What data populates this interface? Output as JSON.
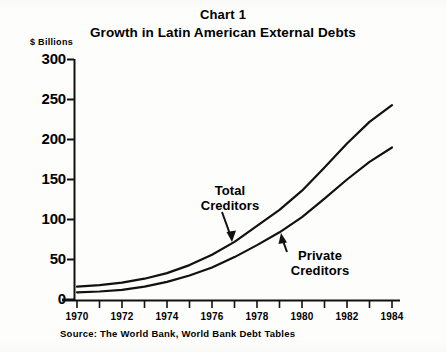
{
  "header": {
    "chart_label": "Chart 1",
    "title": "Growth in Latin American External Debts"
  },
  "axis": {
    "unit_label": "$ Billions",
    "y_ticks": [
      "300",
      "250",
      "200",
      "150",
      "100",
      "50",
      "0"
    ],
    "x_ticks": [
      "1970",
      "1972",
      "1974",
      "1976",
      "1978",
      "1980",
      "1982",
      "1984"
    ]
  },
  "annotations": {
    "total_line1": "Total",
    "total_line2": "Creditors",
    "private_line1": "Private",
    "private_line2": "Creditors"
  },
  "footer": {
    "source": "Source:  The World Bank, World Bank Debt Tables"
  },
  "colors": {
    "ink": "#111111",
    "paper": "#fdfdfc"
  },
  "chart_data": {
    "type": "line",
    "title": "Growth in Latin American External Debts",
    "subtitle": "Chart 1",
    "xlabel": "",
    "ylabel": "$ Billions",
    "xlim": [
      1970,
      1984
    ],
    "ylim": [
      0,
      300
    ],
    "y_ticks": [
      0,
      50,
      100,
      150,
      200,
      250,
      300
    ],
    "x_ticks": [
      1970,
      1972,
      1974,
      1976,
      1978,
      1980,
      1982,
      1984
    ],
    "x_minor_ticks": [
      1971,
      1973,
      1975,
      1977,
      1979,
      1981,
      1983
    ],
    "grid": false,
    "legend": "annotated-inline",
    "source": "Source:  The World Bank, World Bank Debt Tables",
    "x": [
      1970,
      1971,
      1972,
      1973,
      1974,
      1975,
      1976,
      1977,
      1978,
      1979,
      1980,
      1981,
      1982,
      1983,
      1984
    ],
    "series": [
      {
        "name": "Total Creditors",
        "annotation": "Total Creditors",
        "values": [
          16,
          18,
          21,
          26,
          33,
          43,
          56,
          72,
          92,
          112,
          136,
          165,
          195,
          222,
          243
        ]
      },
      {
        "name": "Private Creditors",
        "annotation": "Private Creditors",
        "values": [
          9,
          10,
          12,
          16,
          22,
          30,
          40,
          53,
          68,
          84,
          103,
          126,
          150,
          172,
          190
        ]
      }
    ]
  }
}
